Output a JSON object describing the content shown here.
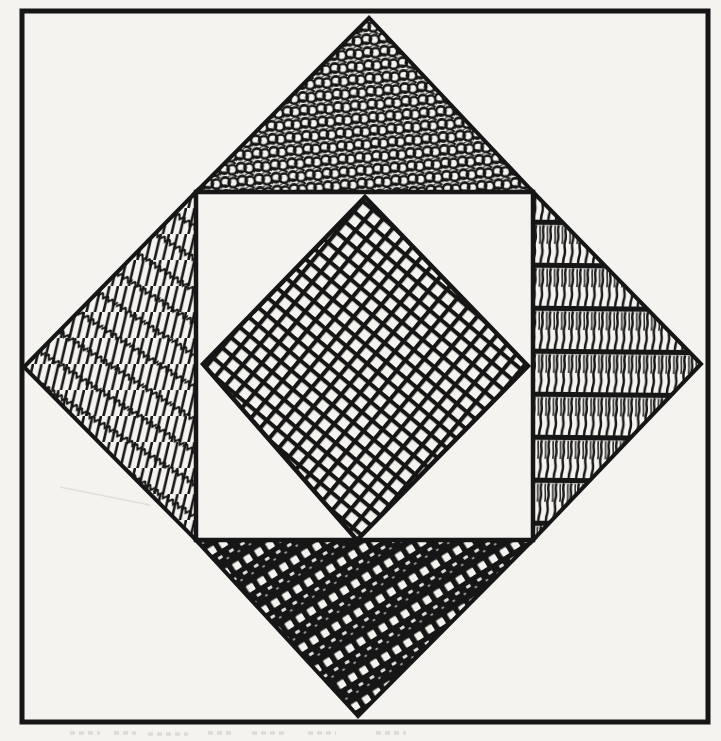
{
  "figure": {
    "canvas": {
      "width": 721,
      "height": 741
    },
    "colors": {
      "paper": "#f5f3ef",
      "ink": "#161616"
    },
    "shapes": [
      {
        "name": "outer-square-border",
        "type": "rect",
        "x": 22,
        "y": 11,
        "width": 686,
        "height": 711,
        "fill": "none",
        "textures": null,
        "stroke_width": 5
      },
      {
        "name": "diamond-top-triangle",
        "type": "polygon",
        "textures": [
          "loop-scribble"
        ],
        "points": [
          [
            369,
            18
          ],
          [
            196,
            192
          ],
          [
            533,
            192
          ]
        ],
        "stroke_width": 4
      },
      {
        "name": "diamond-left-triangle",
        "type": "polygon",
        "textures": [
          "steep-lines",
          "zigzag-rows"
        ],
        "points": [
          [
            24,
            367
          ],
          [
            196,
            192
          ],
          [
            196,
            540
          ]
        ],
        "stroke_width": 4
      },
      {
        "name": "diamond-right-triangle",
        "type": "polygon",
        "textures": [
          "horizontal-bands-squiggle"
        ],
        "points": [
          [
            701,
            364
          ],
          [
            533,
            192
          ],
          [
            533,
            540
          ]
        ],
        "stroke_width": 4
      },
      {
        "name": "diamond-bottom-triangle",
        "type": "polygon",
        "textures": [
          "diagonal-ladder"
        ],
        "points": [
          [
            358,
            716
          ],
          [
            196,
            540
          ],
          [
            533,
            540
          ]
        ],
        "stroke_width": 4
      },
      {
        "name": "inner-white-square",
        "type": "polygon",
        "fill": "paper",
        "textures": null,
        "points": [
          [
            196,
            192
          ],
          [
            533,
            192
          ],
          [
            533,
            540
          ],
          [
            196,
            540
          ]
        ],
        "stroke_width": 4.5
      },
      {
        "name": "inner-diamond",
        "type": "polygon",
        "textures": [
          "cross-grid"
        ],
        "points": [
          [
            365,
            197
          ],
          [
            528,
            366
          ],
          [
            357,
            540
          ],
          [
            203,
            364
          ]
        ],
        "stroke_width": 4.5
      }
    ]
  }
}
